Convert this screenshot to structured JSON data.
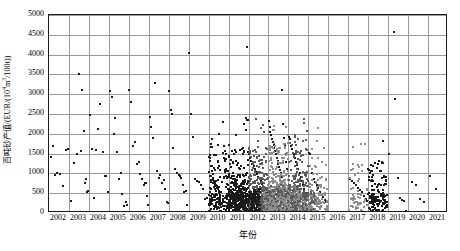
{
  "chart_data": {
    "type": "scatter",
    "title": "",
    "xlabel": "年份",
    "ylabel": "百吨砂产值/(EUR/(10⁴m³/100t))",
    "ylabel_prefix": "百吨砂产值/(EUR/(10",
    "ylabel_sup": "4",
    "ylabel_mid": "m",
    "ylabel_sup2": "3",
    "ylabel_suffix": "/100t))",
    "xlim": [
      2002,
      2021
    ],
    "ylim": [
      0,
      5000
    ],
    "grid": true,
    "legend": "none",
    "categories": [
      "2002",
      "2003",
      "2004",
      "2005",
      "2006",
      "2007",
      "2008",
      "2009",
      "2010",
      "2011",
      "2012",
      "2013",
      "2014",
      "2015",
      "2016",
      "2017",
      "2018",
      "2019",
      "2020",
      "2021"
    ],
    "yticks": [
      0,
      500,
      1000,
      1500,
      2000,
      2500,
      3000,
      3500,
      4000,
      4500,
      5000
    ],
    "marker_color": "#1b1b1b",
    "dense_color": "#8d8d8d",
    "grid_color": "#9a9a9a",
    "frame_color": "#1a1a1a",
    "point_count_note": "~1800 points",
    "series": [
      {
        "name": "百吨砂产值",
        "points": [
          [
            2002.1,
            1410
          ],
          [
            2002.2,
            1700
          ],
          [
            2002.28,
            960
          ],
          [
            2002.42,
            1000
          ],
          [
            2002.55,
            980
          ],
          [
            2002.7,
            670
          ],
          [
            2002.85,
            1590
          ],
          [
            2002.95,
            1610
          ],
          [
            2003.1,
            310
          ],
          [
            2003.25,
            1270
          ],
          [
            2003.38,
            1500
          ],
          [
            2003.5,
            3500
          ],
          [
            2003.58,
            1560
          ],
          [
            2003.66,
            3100
          ],
          [
            2003.74,
            2060
          ],
          [
            2003.8,
            760
          ],
          [
            2003.86,
            860
          ],
          [
            2003.92,
            520
          ],
          [
            2003.97,
            560
          ],
          [
            2004.05,
            2480
          ],
          [
            2004.15,
            1620
          ],
          [
            2004.25,
            380
          ],
          [
            2004.35,
            1600
          ],
          [
            2004.45,
            2110
          ],
          [
            2004.58,
            2750
          ],
          [
            2004.7,
            1530
          ],
          [
            2004.8,
            940
          ],
          [
            2004.88,
            930
          ],
          [
            2004.95,
            540
          ],
          [
            2005.05,
            3080
          ],
          [
            2005.15,
            2930
          ],
          [
            2005.25,
            2000
          ],
          [
            2005.33,
            2390
          ],
          [
            2005.42,
            1530
          ],
          [
            2005.52,
            860
          ],
          [
            2005.6,
            1000
          ],
          [
            2005.68,
            480
          ],
          [
            2005.76,
            175
          ],
          [
            2005.84,
            270
          ],
          [
            2005.92,
            200
          ],
          [
            2006.02,
            3110
          ],
          [
            2006.1,
            2810
          ],
          [
            2006.2,
            1700
          ],
          [
            2006.3,
            1800
          ],
          [
            2006.4,
            1240
          ],
          [
            2006.5,
            1290
          ],
          [
            2006.58,
            980
          ],
          [
            2006.66,
            860
          ],
          [
            2006.74,
            700
          ],
          [
            2006.8,
            755
          ],
          [
            2006.86,
            760
          ],
          [
            2006.92,
            420
          ],
          [
            2006.97,
            200
          ],
          [
            2007.05,
            2420
          ],
          [
            2007.13,
            2170
          ],
          [
            2007.22,
            1900
          ],
          [
            2007.32,
            3290
          ],
          [
            2007.42,
            1050
          ],
          [
            2007.5,
            880
          ],
          [
            2007.58,
            950
          ],
          [
            2007.66,
            770
          ],
          [
            2007.74,
            830
          ],
          [
            2007.82,
            600
          ],
          [
            2007.9,
            270
          ],
          [
            2007.96,
            240
          ],
          [
            2008.04,
            3070
          ],
          [
            2008.12,
            2610
          ],
          [
            2008.16,
            2500
          ],
          [
            2008.24,
            1650
          ],
          [
            2008.34,
            1110
          ],
          [
            2008.44,
            1000
          ],
          [
            2008.5,
            960
          ],
          [
            2008.56,
            930
          ],
          [
            2008.62,
            880
          ],
          [
            2008.7,
            700
          ],
          [
            2008.78,
            520
          ],
          [
            2008.86,
            560
          ],
          [
            2008.94,
            210
          ],
          [
            2009.02,
            4050
          ],
          [
            2009.1,
            2510
          ],
          [
            2009.2,
            1910
          ],
          [
            2009.3,
            860
          ],
          [
            2009.4,
            800
          ],
          [
            2009.5,
            790
          ],
          [
            2009.6,
            700
          ],
          [
            2009.7,
            610
          ],
          [
            2009.8,
            355
          ],
          [
            2009.9,
            390
          ],
          [
            2010.05,
            1460
          ],
          [
            2010.1,
            1180
          ],
          [
            2010.15,
            1060
          ],
          [
            2010.2,
            880
          ],
          [
            2010.25,
            820
          ],
          [
            2010.3,
            760
          ],
          [
            2010.35,
            700
          ],
          [
            2010.4,
            640
          ],
          [
            2010.45,
            600
          ],
          [
            2010.5,
            560
          ],
          [
            2010.55,
            520
          ],
          [
            2010.58,
            300
          ],
          [
            2010.62,
            250
          ],
          [
            2010.66,
            230
          ],
          [
            2010.7,
            2310
          ],
          [
            2010.75,
            1700
          ],
          [
            2010.8,
            1560
          ],
          [
            2010.85,
            1360
          ],
          [
            2010.88,
            1100
          ],
          [
            2010.92,
            900
          ],
          [
            2010.95,
            700
          ],
          [
            2010.97,
            420
          ],
          [
            2011.02,
            1440
          ],
          [
            2011.08,
            1250
          ],
          [
            2011.14,
            1150
          ],
          [
            2011.2,
            1000
          ],
          [
            2011.26,
            930
          ],
          [
            2011.32,
            860
          ],
          [
            2011.38,
            790
          ],
          [
            2011.44,
            720
          ],
          [
            2011.5,
            660
          ],
          [
            2011.56,
            600
          ],
          [
            2011.6,
            540
          ],
          [
            2011.64,
            480
          ],
          [
            2011.68,
            420
          ],
          [
            2011.72,
            360
          ],
          [
            2011.76,
            300
          ],
          [
            2011.8,
            250
          ],
          [
            2011.84,
            200
          ],
          [
            2011.88,
            2400
          ],
          [
            2011.9,
            2360
          ],
          [
            2011.93,
            4200
          ],
          [
            2011.96,
            1550
          ],
          [
            2012.02,
            1480
          ],
          [
            2012.08,
            1400
          ],
          [
            2012.14,
            1320
          ],
          [
            2012.2,
            1250
          ],
          [
            2012.26,
            1180
          ],
          [
            2012.32,
            1100
          ],
          [
            2012.38,
            1040
          ],
          [
            2012.44,
            980
          ],
          [
            2012.5,
            920
          ],
          [
            2012.56,
            860
          ],
          [
            2012.62,
            800
          ],
          [
            2012.68,
            740
          ],
          [
            2012.74,
            680
          ],
          [
            2012.8,
            620
          ],
          [
            2012.86,
            560
          ],
          [
            2012.92,
            500
          ],
          [
            2012.96,
            440
          ],
          [
            2013.02,
            2320
          ],
          [
            2013.06,
            2180
          ],
          [
            2013.1,
            2050
          ],
          [
            2013.14,
            1960
          ],
          [
            2013.18,
            1880
          ],
          [
            2013.22,
            1800
          ],
          [
            2013.26,
            1720
          ],
          [
            2013.3,
            1640
          ],
          [
            2013.34,
            1560
          ],
          [
            2013.38,
            1480
          ],
          [
            2013.42,
            1400
          ],
          [
            2013.46,
            1320
          ],
          [
            2013.5,
            1240
          ],
          [
            2013.54,
            1160
          ],
          [
            2013.58,
            1080
          ],
          [
            2013.62,
            1000
          ],
          [
            2013.66,
            920
          ],
          [
            2013.7,
            3110
          ],
          [
            2013.74,
            2240
          ],
          [
            2013.78,
            1900
          ],
          [
            2013.82,
            1700
          ],
          [
            2013.86,
            1500
          ],
          [
            2013.9,
            1300
          ],
          [
            2013.94,
            1100
          ],
          [
            2014.02,
            1930
          ],
          [
            2014.08,
            1880
          ],
          [
            2014.14,
            1700
          ],
          [
            2014.2,
            1620
          ],
          [
            2014.26,
            1500
          ],
          [
            2014.32,
            1400
          ],
          [
            2014.38,
            1300
          ],
          [
            2014.44,
            1200
          ],
          [
            2014.5,
            1100
          ],
          [
            2014.56,
            1000
          ],
          [
            2014.62,
            900
          ],
          [
            2014.68,
            800
          ],
          [
            2014.74,
            700
          ],
          [
            2014.8,
            600
          ],
          [
            2014.86,
            500
          ],
          [
            2014.92,
            400
          ],
          [
            2015.02,
            1510
          ],
          [
            2015.1,
            1480
          ],
          [
            2015.18,
            1000
          ],
          [
            2015.26,
            860
          ],
          [
            2015.34,
            780
          ],
          [
            2015.42,
            700
          ],
          [
            2015.5,
            620
          ],
          [
            2015.58,
            540
          ],
          [
            2015.66,
            460
          ],
          [
            2015.74,
            400
          ],
          [
            2015.82,
            340
          ],
          [
            2015.9,
            280
          ],
          [
            2017.1,
            870
          ],
          [
            2017.2,
            800
          ],
          [
            2017.3,
            760
          ],
          [
            2017.4,
            700
          ],
          [
            2017.5,
            640
          ],
          [
            2017.6,
            580
          ],
          [
            2017.7,
            520
          ],
          [
            2017.8,
            440
          ],
          [
            2017.88,
            360
          ],
          [
            2017.94,
            300
          ],
          [
            2018.02,
            1080
          ],
          [
            2018.1,
            1010
          ],
          [
            2018.18,
            900
          ],
          [
            2018.26,
            820
          ],
          [
            2018.34,
            740
          ],
          [
            2018.42,
            660
          ],
          [
            2018.5,
            580
          ],
          [
            2018.56,
            520
          ],
          [
            2018.62,
            470
          ],
          [
            2018.68,
            420
          ],
          [
            2018.74,
            380
          ],
          [
            2018.8,
            340
          ],
          [
            2018.86,
            300
          ],
          [
            2018.92,
            270
          ],
          [
            2019.05,
            1480
          ],
          [
            2019.3,
            4570
          ],
          [
            2019.35,
            2880
          ],
          [
            2019.5,
            880
          ],
          [
            2019.6,
            380
          ],
          [
            2019.7,
            330
          ],
          [
            2019.8,
            300
          ],
          [
            2019.9,
            60
          ],
          [
            2020.2,
            790
          ],
          [
            2020.4,
            700
          ],
          [
            2020.6,
            350
          ],
          [
            2020.8,
            290
          ],
          [
            2021.1,
            930
          ],
          [
            2021.4,
            610
          ]
        ]
      }
    ]
  },
  "axes": {
    "x_tick_labels": [
      "2002",
      "2003",
      "2004",
      "2005",
      "2006",
      "2007",
      "2008",
      "2009",
      "2010",
      "2011",
      "2012",
      "2013",
      "2014",
      "2015",
      "2016",
      "2017",
      "2018",
      "2019",
      "2020",
      "2021"
    ],
    "y_tick_labels": [
      "0",
      "500",
      "1000",
      "1500",
      "2000",
      "2500",
      "3000",
      "3500",
      "4000",
      "4500",
      "5000"
    ]
  }
}
